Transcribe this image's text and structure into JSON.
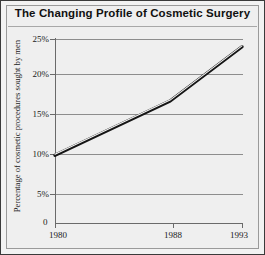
{
  "chart_data": {
    "type": "line",
    "title": "The Changing Profile of Cosmetic Surgery",
    "xlabel": "",
    "ylabel": "Percentage of cosmetic procedures sought by men",
    "x": [
      1980,
      1988,
      1993
    ],
    "xtick_labels": [
      "1980",
      "1988",
      "1993"
    ],
    "origin_label": "0",
    "values": [
      10,
      17,
      24
    ],
    "ylim": [
      0,
      25
    ],
    "ytick_labels": [
      "5%",
      "10%",
      "15%",
      "20%",
      "25%"
    ],
    "ytick_values": [
      5,
      10,
      15,
      20,
      25
    ],
    "grid": true,
    "legend": "none",
    "series": [
      {
        "name": "Percentage of cosmetic procedures sought by men",
        "values": [
          10,
          17,
          24
        ]
      }
    ]
  },
  "style": {
    "line_color": "#151515",
    "line_highlight": "#f4f4f4",
    "grid_color": "#8d8d8d",
    "axis_color": "#6a6a6a",
    "background": "#efefef",
    "frame_color": "#3a3a3a",
    "text_color": "#1a1a1a"
  }
}
